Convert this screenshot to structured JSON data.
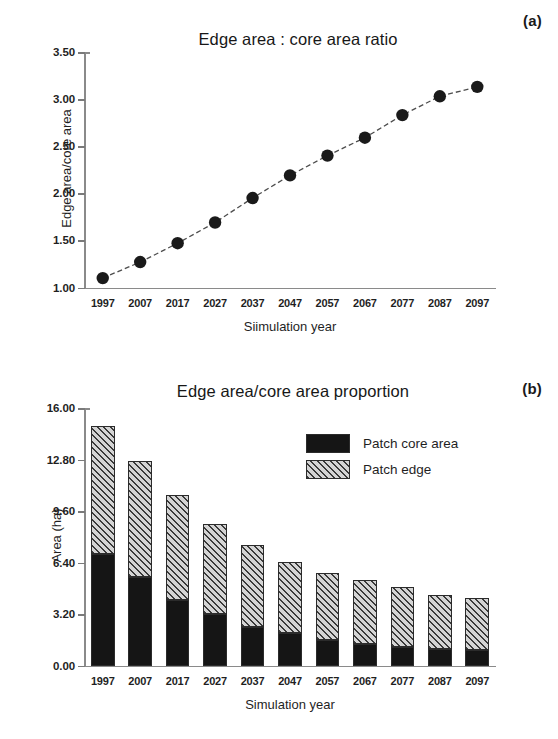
{
  "figure": {
    "panels": [
      {
        "tag": "(a)"
      },
      {
        "tag": "(b)"
      }
    ]
  },
  "chart_data": [
    {
      "type": "line",
      "panel": "(a)",
      "title": "Edge area : core area ratio",
      "xlabel": "Siimulation year",
      "ylabel": "Edge area/core area",
      "categories": [
        "1997",
        "2007",
        "2017",
        "2027",
        "2037",
        "2047",
        "2057",
        "2067",
        "2077",
        "2087",
        "2097"
      ],
      "values": [
        1.1,
        1.27,
        1.47,
        1.69,
        1.95,
        2.19,
        2.4,
        2.59,
        2.83,
        3.03,
        3.13
      ],
      "ylim": [
        1.0,
        3.5
      ],
      "yticks": [
        "1.00",
        "1.50",
        "2.00",
        "2.50",
        "3.00",
        "3.50"
      ],
      "ytick_values": [
        1.0,
        1.5,
        2.0,
        2.5,
        3.0,
        3.5
      ],
      "grid": false,
      "legend": "none",
      "marker": "filled-circle",
      "marker_color": "#1a1a1a",
      "line_style": "dashed",
      "line_color": "#4d4d4d"
    },
    {
      "type": "bar",
      "subtype": "stacked",
      "panel": "(b)",
      "title": "Edge area/core area proportion",
      "xlabel": "Simulation year",
      "ylabel": "Area (ha)",
      "categories": [
        "1997",
        "2007",
        "2017",
        "2027",
        "2037",
        "2047",
        "2057",
        "2067",
        "2077",
        "2087",
        "2097"
      ],
      "series": [
        {
          "name": "Patch core area",
          "fill": "solid-black",
          "color": "#151515",
          "values": [
            6.9,
            5.5,
            4.1,
            3.2,
            2.4,
            2.0,
            1.6,
            1.35,
            1.15,
            1.0,
            0.95
          ]
        },
        {
          "name": "Patch edge",
          "fill": "diagonal-hatch",
          "color": "#d4d4d4",
          "values": [
            8.0,
            7.2,
            6.5,
            5.6,
            5.1,
            4.45,
            4.15,
            3.95,
            3.7,
            3.4,
            3.25
          ]
        }
      ],
      "totals": [
        14.9,
        12.7,
        10.6,
        8.8,
        7.5,
        6.45,
        5.75,
        5.3,
        4.85,
        4.4,
        4.2
      ],
      "ylim": [
        0.0,
        16.0
      ],
      "yticks": [
        "0.00",
        "3.20",
        "6.40",
        "9.60",
        "12.80",
        "16.00"
      ],
      "ytick_values": [
        0.0,
        3.2,
        6.4,
        9.6,
        12.8,
        16.0
      ],
      "grid": false,
      "legend_position": "upper-right",
      "legend_entries": [
        "Patch core area",
        "Patch edge"
      ]
    }
  ]
}
